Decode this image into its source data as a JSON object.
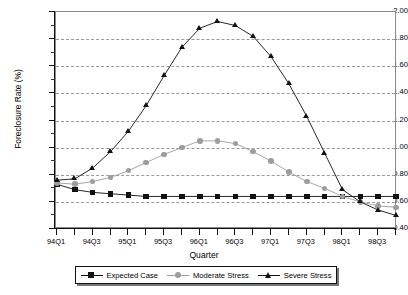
{
  "chart_data": {
    "type": "line",
    "title": "",
    "xlabel": "Quarter",
    "ylabel": "Foreclosure Rate (%)",
    "ylim": [
      0.4,
      2.0
    ],
    "yticks": [
      "0.40",
      "0.60",
      "0.80",
      "1.00",
      "1.20",
      "1.40",
      "1.60",
      "1.80",
      "2.00"
    ],
    "grid": true,
    "legend_position": "bottom",
    "x": [
      "94Q1",
      "94Q2",
      "94Q3",
      "94Q4",
      "95Q1",
      "95Q2",
      "95Q3",
      "95Q4",
      "96Q1",
      "96Q2",
      "96Q3",
      "96Q4",
      "97Q1",
      "97Q2",
      "97Q3",
      "97Q4",
      "98Q1",
      "98Q2",
      "98Q3",
      "98Q4"
    ],
    "xtick_labels": [
      "94Q1",
      "94Q3",
      "95Q1",
      "95Q3",
      "96Q1",
      "96Q3",
      "97Q1",
      "97Q3",
      "98Q1",
      "98Q3"
    ],
    "series": [
      {
        "name": "Expected Case",
        "color": "#111111",
        "marker": "square",
        "values": [
          0.73,
          0.69,
          0.67,
          0.66,
          0.65,
          0.64,
          0.64,
          0.64,
          0.64,
          0.64,
          0.64,
          0.64,
          0.64,
          0.64,
          0.64,
          0.64,
          0.64,
          0.64,
          0.64,
          0.64
        ]
      },
      {
        "name": "Moderate Stress",
        "color": "#9d9d9d",
        "marker": "circle",
        "values": [
          0.74,
          0.73,
          0.75,
          0.78,
          0.83,
          0.89,
          0.95,
          1.0,
          1.05,
          1.05,
          1.03,
          0.97,
          0.9,
          0.82,
          0.75,
          0.7,
          0.64,
          0.6,
          0.57,
          0.56
        ]
      },
      {
        "name": "Severe Stress",
        "color": "#111111",
        "marker": "triangle",
        "values": [
          0.76,
          0.77,
          0.85,
          0.97,
          1.12,
          1.31,
          1.53,
          1.74,
          1.88,
          1.93,
          1.9,
          1.82,
          1.67,
          1.47,
          1.23,
          0.96,
          0.69,
          0.6,
          0.54,
          0.5
        ]
      }
    ]
  }
}
